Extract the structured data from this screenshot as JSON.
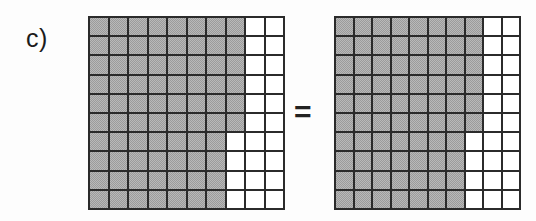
{
  "figure": {
    "panel_label": "c)",
    "equals_symbol": "=",
    "colors": {
      "shaded_cell": "#9b9b9b",
      "empty_cell": "#ffffff",
      "grid_line": "#2b2b2b",
      "background": "#fdfdfd",
      "text": "#1b1b1b"
    }
  },
  "chart_data": {
    "type": "heatmap",
    "title": "c)",
    "xlabel": "",
    "ylabel": "",
    "grid": true,
    "legend": "none",
    "rows": 10,
    "columns": 10,
    "value_legend": {
      "1": "shaded",
      "0": "empty"
    },
    "panels": [
      {
        "name": "left-grid",
        "shaded_count": 76,
        "empty_count": 24,
        "values": [
          [
            1,
            1,
            1,
            1,
            1,
            1,
            1,
            1,
            0,
            0
          ],
          [
            1,
            1,
            1,
            1,
            1,
            1,
            1,
            1,
            0,
            0
          ],
          [
            1,
            1,
            1,
            1,
            1,
            1,
            1,
            1,
            0,
            0
          ],
          [
            1,
            1,
            1,
            1,
            1,
            1,
            1,
            1,
            0,
            0
          ],
          [
            1,
            1,
            1,
            1,
            1,
            1,
            1,
            1,
            0,
            0
          ],
          [
            1,
            1,
            1,
            1,
            1,
            1,
            1,
            1,
            0,
            0
          ],
          [
            1,
            1,
            1,
            1,
            1,
            1,
            1,
            0,
            0,
            0
          ],
          [
            1,
            1,
            1,
            1,
            1,
            1,
            1,
            0,
            0,
            0
          ],
          [
            1,
            1,
            1,
            1,
            1,
            1,
            1,
            0,
            0,
            0
          ],
          [
            1,
            1,
            1,
            1,
            1,
            1,
            1,
            0,
            0,
            0
          ]
        ]
      },
      {
        "name": "right-grid",
        "shaded_count": 76,
        "empty_count": 24,
        "values": [
          [
            1,
            1,
            1,
            1,
            1,
            1,
            1,
            1,
            0,
            0
          ],
          [
            1,
            1,
            1,
            1,
            1,
            1,
            1,
            1,
            0,
            0
          ],
          [
            1,
            1,
            1,
            1,
            1,
            1,
            1,
            1,
            0,
            0
          ],
          [
            1,
            1,
            1,
            1,
            1,
            1,
            1,
            1,
            0,
            0
          ],
          [
            1,
            1,
            1,
            1,
            1,
            1,
            1,
            1,
            0,
            0
          ],
          [
            1,
            1,
            1,
            1,
            1,
            1,
            1,
            1,
            0,
            0
          ],
          [
            1,
            1,
            1,
            1,
            1,
            1,
            1,
            0,
            0,
            0
          ],
          [
            1,
            1,
            1,
            1,
            1,
            1,
            1,
            0,
            0,
            0
          ],
          [
            1,
            1,
            1,
            1,
            1,
            1,
            1,
            0,
            0,
            0
          ],
          [
            1,
            1,
            1,
            1,
            1,
            1,
            1,
            0,
            0,
            0
          ]
        ]
      }
    ]
  }
}
